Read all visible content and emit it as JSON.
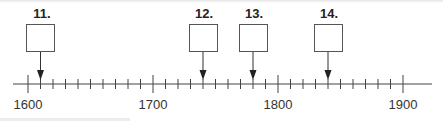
{
  "timeline": {
    "start_year": 1600,
    "end_year": 1900,
    "tick_interval_years": 10,
    "year_labels": [
      "1600",
      "1700",
      "1800",
      "1900"
    ],
    "markers": [
      {
        "label": "11.",
        "year": 1610
      },
      {
        "label": "12.",
        "year": 1740
      },
      {
        "label": "13.",
        "year": 1780
      },
      {
        "label": "14.",
        "year": 1840
      }
    ]
  },
  "colors": {
    "line": "#444444",
    "text": "#222222"
  }
}
